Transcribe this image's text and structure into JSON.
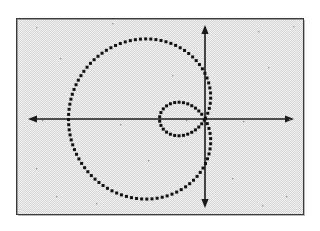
{
  "figure": {
    "title": "",
    "caption": "",
    "background_color": "#e9e9e9",
    "frame_color": "#3a3a3a",
    "ink_color": "#111111",
    "page_color": "#ffffff"
  },
  "axes": {
    "x_axis_label": "",
    "y_axis_label": "",
    "origin_label": "",
    "x_arrow_left": "arrow-left-icon",
    "x_arrow_right": "arrow-right-icon",
    "y_arrow_up": "arrow-up-icon",
    "y_arrow_down": "arrow-down-icon"
  },
  "chart_data": {
    "type": "line",
    "title": "",
    "subtitle": "",
    "xlabel": "",
    "ylabel": "",
    "plot_style": "dotted-markers",
    "coordinate_system": "polar",
    "grid": false,
    "legend": [],
    "legend_position": "none",
    "xlim": [
      -4.0,
      3.0
    ],
    "ylim": [
      -2.4,
      2.4
    ],
    "x_ticks": [],
    "y_ticks": [],
    "annotations": [],
    "series": [
      {
        "name": "limacon-outer-loop",
        "equation": "r = 1 + 2 cos(theta), reflected about the y-axis",
        "marker": "square-dot",
        "marker_size_px": 3,
        "closed": true,
        "points_polar_deg": [
          {
            "theta": 0,
            "r": 3.0
          },
          {
            "theta": 10,
            "r": 2.97
          },
          {
            "theta": 20,
            "r": 2.88
          },
          {
            "theta": 30,
            "r": 2.73
          },
          {
            "theta": 40,
            "r": 2.53
          },
          {
            "theta": 50,
            "r": 2.29
          },
          {
            "theta": 60,
            "r": 2.0
          },
          {
            "theta": 70,
            "r": 1.68
          },
          {
            "theta": 80,
            "r": 1.35
          },
          {
            "theta": 90,
            "r": 1.0
          },
          {
            "theta": 100,
            "r": 0.65
          },
          {
            "theta": 110,
            "r": 0.32
          },
          {
            "theta": 120,
            "r": 0.0
          },
          {
            "theta": 240,
            "r": 0.0
          },
          {
            "theta": 250,
            "r": 0.32
          },
          {
            "theta": 260,
            "r": 0.65
          },
          {
            "theta": 270,
            "r": 1.0
          },
          {
            "theta": 280,
            "r": 1.35
          },
          {
            "theta": 290,
            "r": 1.68
          },
          {
            "theta": 300,
            "r": 2.0
          },
          {
            "theta": 310,
            "r": 2.29
          },
          {
            "theta": 320,
            "r": 2.53
          },
          {
            "theta": 330,
            "r": 2.73
          },
          {
            "theta": 340,
            "r": 2.88
          },
          {
            "theta": 350,
            "r": 2.97
          },
          {
            "theta": 360,
            "r": 3.0
          }
        ],
        "extent_px": {
          "left": 73,
          "right": 212,
          "top": 43,
          "bottom": 194
        }
      },
      {
        "name": "limacon-inner-loop",
        "equation": "r = 1 + 2 cos(theta) for 120 deg < theta < 240 deg (inner loop)",
        "marker": "square-dot",
        "marker_size_px": 3,
        "closed": true,
        "points_polar_deg": [
          {
            "theta": 120,
            "r": 0.0
          },
          {
            "theta": 130,
            "r": -0.29
          },
          {
            "theta": 140,
            "r": -0.53
          },
          {
            "theta": 150,
            "r": -0.73
          },
          {
            "theta": 160,
            "r": -0.88
          },
          {
            "theta": 170,
            "r": -0.97
          },
          {
            "theta": 180,
            "r": -1.0
          },
          {
            "theta": 190,
            "r": -0.97
          },
          {
            "theta": 200,
            "r": -0.88
          },
          {
            "theta": 210,
            "r": -0.73
          },
          {
            "theta": 220,
            "r": -0.53
          },
          {
            "theta": 230,
            "r": -0.29
          },
          {
            "theta": 240,
            "r": 0.0
          }
        ],
        "extent_px": {
          "left": 163,
          "right": 206,
          "top": 101,
          "bottom": 137
        }
      }
    ],
    "origin_px": {
      "x": 205,
      "y": 119
    },
    "scale_px_per_unit": {
      "x": 45.5,
      "y": 45.5
    }
  }
}
